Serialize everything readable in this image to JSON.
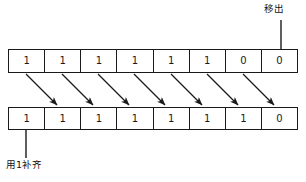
{
  "diagram": {
    "colors": {
      "stroke": "#1a1a1a",
      "background": "#ffffff",
      "text": "#111111"
    },
    "top_register": {
      "name": "source-register",
      "bits": [
        "1",
        "1",
        "1",
        "1",
        "1",
        "1",
        "0",
        "0"
      ]
    },
    "bottom_register": {
      "name": "result-register",
      "bits": [
        "1",
        "1",
        "1",
        "1",
        "1",
        "1",
        "1",
        "0"
      ]
    },
    "annotations": {
      "shift_out": "移出",
      "fill_ones": "用1补齐"
    },
    "arrows": {
      "count": 7,
      "direction": "down-right",
      "description": "each bit moves one position to the right"
    }
  }
}
